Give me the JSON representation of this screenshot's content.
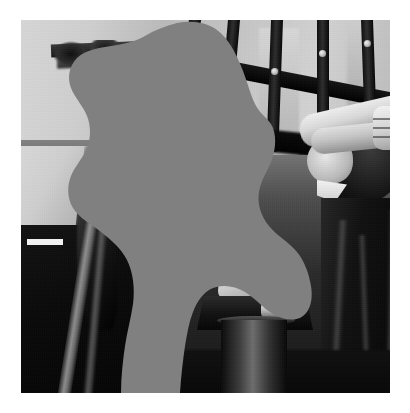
{
  "image": {
    "kind": "photograph",
    "tone": "black-and-white",
    "width": 410,
    "height": 413,
    "frame": {
      "x": 21,
      "y": 20,
      "width": 369,
      "height": 373
    },
    "outer_background_color": "#ffffff"
  },
  "mask": {
    "name": "occlusion-mask",
    "description": "large irregular gray region covering the center of the photograph",
    "color": "#808080",
    "shape": "amorphous-blob"
  },
  "scene": {
    "subjects": [
      {
        "name": "woman-head-top-left",
        "detail": "curly dark hair, forehead and one eye visible above mask"
      },
      {
        "name": "raised-arm-right",
        "detail": "bare forearm crossing diagonally with hand and fingers"
      },
      {
        "name": "face-right",
        "detail": "partially shadowed face beneath the arm"
      },
      {
        "name": "figure-left",
        "detail": "light shoulder above dark coat with diagonal pole"
      },
      {
        "name": "figure-right",
        "detail": "dark draped clothing with vertical folds"
      }
    ],
    "objects": [
      {
        "name": "fire-hydrant",
        "detail": "light domed cap on a dark body with side nozzle"
      },
      {
        "name": "railing-bars",
        "detail": "five dark vertical bars with bright rivets across the top"
      },
      {
        "name": "white-streak",
        "detail": "small bright horizontal bar on the dark left wall"
      }
    ]
  },
  "palette": {
    "mask_gray": "#808080",
    "paper_white": "#ffffff",
    "highlight": "#f2f2f2",
    "midtone": "#9a9a9a",
    "shadow": "#0a0a0a"
  }
}
